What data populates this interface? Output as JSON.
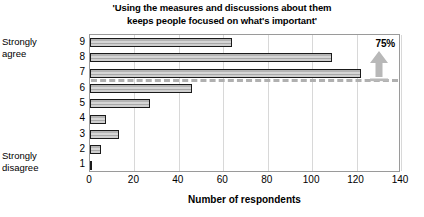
{
  "chart_data": {
    "type": "bar",
    "orientation": "horizontal",
    "title": "'Using the measures and discussions about them keeps people focused on what's important'",
    "title_lines": [
      "'Using the measures and discussions about them",
      "keeps people focused on what's important'"
    ],
    "categories": [
      "9",
      "8",
      "7",
      "6",
      "5",
      "4",
      "3",
      "2",
      "1"
    ],
    "values": [
      64,
      109,
      122,
      46,
      27,
      7,
      13,
      5,
      1
    ],
    "xlabel": "Number of respondents",
    "ylabel": "",
    "xlim": [
      0,
      140
    ],
    "xticks": [
      0,
      20,
      40,
      60,
      80,
      100,
      120,
      140
    ],
    "xtick_labels": [
      "0",
      "20",
      "40",
      "60",
      "80",
      "100",
      "120",
      "140"
    ],
    "grid": true,
    "legend": null,
    "scale_anchors": {
      "high": "Strongly agree",
      "low": "Strongly disagree"
    },
    "annotations": [
      {
        "name": "percent-callout",
        "text": "75%",
        "marker": "up-arrow",
        "threshold_between_categories": [
          "7",
          "6"
        ],
        "note": "dashed reference line below category 7 with upward arrow"
      }
    ],
    "colors": {
      "bar_fill": "#c2c2c2",
      "bar_outline": "#1a1a1a",
      "gridline": "#d8d8d8",
      "frame": "#9a9a9a",
      "annotation_gray": "#b0b0b0",
      "text": "#000000"
    }
  }
}
